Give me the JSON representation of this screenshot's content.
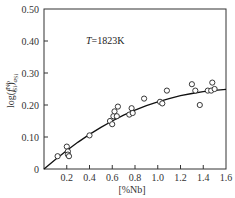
{
  "chart_data": {
    "type": "scatter",
    "title": "",
    "annotation": {
      "prefix": "T",
      "text": "=1823K"
    },
    "xlabel": "[%Nb]",
    "ylabel": "log(f_Si^Nb)_aSi",
    "ylabel_parts": {
      "base": "log(",
      "f": "f",
      "sup": "Nb",
      "sub": "Si",
      "close": ")",
      "outer_sub": "a",
      "outer_sub2": "Si"
    },
    "xlim": [
      0,
      1.6
    ],
    "ylim": [
      0,
      0.5
    ],
    "x_ticks": [
      "0.2",
      "0.4",
      "0.6",
      "0.8",
      "1.0",
      "1.2",
      "1.4",
      "1.6"
    ],
    "x_tick_values": [
      0.2,
      0.4,
      0.6,
      0.8,
      1.0,
      1.2,
      1.4,
      1.6
    ],
    "y_ticks": [
      "0",
      "0.10",
      "0.20",
      "0.30",
      "0.40",
      "0.50"
    ],
    "y_tick_values": [
      0,
      0.1,
      0.2,
      0.3,
      0.4,
      0.5
    ],
    "grid": false,
    "legend": null,
    "series": [
      {
        "name": "measured",
        "marker": "open-circle",
        "points": [
          [
            0.12,
            0.04
          ],
          [
            0.2,
            0.07
          ],
          [
            0.21,
            0.055
          ],
          [
            0.21,
            0.045
          ],
          [
            0.22,
            0.04
          ],
          [
            0.4,
            0.105
          ],
          [
            0.58,
            0.15
          ],
          [
            0.6,
            0.14
          ],
          [
            0.61,
            0.165
          ],
          [
            0.62,
            0.18
          ],
          [
            0.64,
            0.165
          ],
          [
            0.65,
            0.195
          ],
          [
            0.75,
            0.17
          ],
          [
            0.77,
            0.19
          ],
          [
            0.78,
            0.175
          ],
          [
            0.88,
            0.22
          ],
          [
            1.02,
            0.21
          ],
          [
            1.04,
            0.205
          ],
          [
            1.08,
            0.245
          ],
          [
            1.3,
            0.265
          ],
          [
            1.33,
            0.245
          ],
          [
            1.37,
            0.2
          ],
          [
            1.44,
            0.245
          ],
          [
            1.47,
            0.245
          ],
          [
            1.48,
            0.27
          ],
          [
            1.5,
            0.25
          ]
        ]
      },
      {
        "name": "fit",
        "style": "line",
        "points": [
          [
            0,
            0
          ],
          [
            0.1,
            0.03
          ],
          [
            0.2,
            0.058
          ],
          [
            0.3,
            0.084
          ],
          [
            0.4,
            0.108
          ],
          [
            0.5,
            0.13
          ],
          [
            0.6,
            0.15
          ],
          [
            0.7,
            0.168
          ],
          [
            0.8,
            0.184
          ],
          [
            0.9,
            0.198
          ],
          [
            1.0,
            0.21
          ],
          [
            1.1,
            0.22
          ],
          [
            1.2,
            0.229
          ],
          [
            1.3,
            0.236
          ],
          [
            1.4,
            0.242
          ],
          [
            1.5,
            0.246
          ],
          [
            1.6,
            0.249
          ]
        ]
      }
    ]
  }
}
